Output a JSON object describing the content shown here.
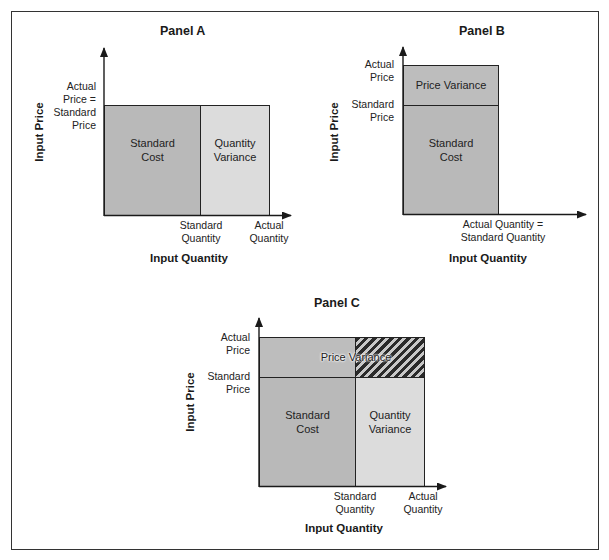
{
  "panels": {
    "a": {
      "title": "Panel A",
      "y_axis_title": "Input Price",
      "x_axis_title": "Input Quantity",
      "y_ticks": [
        "Actual",
        "Price =",
        "Standard",
        "Price"
      ],
      "x_ticks": {
        "standard_quantity": [
          "Standard",
          "Quantity"
        ],
        "actual_quantity": [
          "Actual",
          "Quantity"
        ]
      },
      "regions": {
        "standard_cost": [
          "Standard",
          "Cost"
        ],
        "quantity_variance": [
          "Quantity",
          "Variance"
        ]
      }
    },
    "b": {
      "title": "Panel B",
      "y_axis_title": "Input Price",
      "x_axis_title": "Input Quantity",
      "y_ticks": {
        "actual_price": [
          "Actual",
          "Price"
        ],
        "standard_price": [
          "Standard",
          "Price"
        ]
      },
      "x_ticks": [
        "Actual Quantity =",
        "Standard Quantity"
      ],
      "regions": {
        "price_variance": "Price Variance",
        "standard_cost": [
          "Standard",
          "Cost"
        ]
      }
    },
    "c": {
      "title": "Panel C",
      "y_axis_title": "Input Price",
      "x_axis_title": "Input Quantity",
      "y_ticks": {
        "actual_price": [
          "Actual",
          "Price"
        ],
        "standard_price": [
          "Standard",
          "Price"
        ]
      },
      "x_ticks": {
        "standard_quantity": [
          "Standard",
          "Quantity"
        ],
        "actual_quantity": [
          "Actual",
          "Quantity"
        ]
      },
      "regions": {
        "price_variance": "Price Variance",
        "standard_cost": [
          "Standard",
          "Cost"
        ],
        "quantity_variance": [
          "Quantity",
          "Variance"
        ]
      }
    }
  },
  "colors": {
    "standard_cost_fill": "#b9b9b9",
    "quantity_variance_fill": "#dcdcdc",
    "price_variance_fill": "#bdbdbd",
    "joint_variance_hatch": "#2a2a2a",
    "lines": "#222222"
  }
}
